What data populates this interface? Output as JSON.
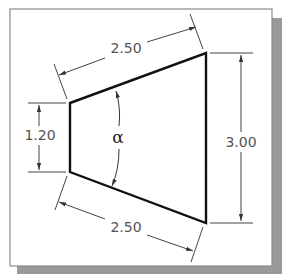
{
  "figure": {
    "dimensions": {
      "top_slanted_edge": "2.50",
      "bottom_slanted_edge": "2.50",
      "left_height": "1.20",
      "right_height": "3.00"
    },
    "angle_label": "α"
  },
  "colors": {
    "outline": "#111111",
    "dimension_lines": "#444444",
    "frame": "#888888",
    "shadow": "#9a9a9a",
    "background": "#ffffff"
  }
}
